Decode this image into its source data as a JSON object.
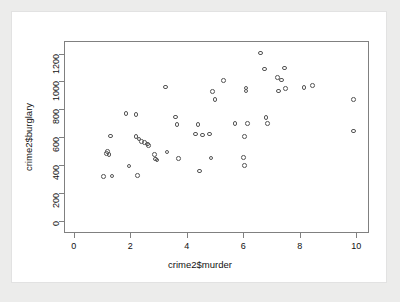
{
  "chart_data": {
    "type": "scatter",
    "title": "",
    "xlabel": "crime2$murder",
    "ylabel": "crime2$burglary",
    "xlim": [
      -0.35,
      10.45
    ],
    "ylim": [
      -85,
      1290
    ],
    "xticks": [
      0,
      2,
      4,
      6,
      8,
      10
    ],
    "yticks": [
      0,
      200,
      400,
      600,
      800,
      1000,
      1200
    ],
    "grid": false,
    "legend": null,
    "point_symbol": "open-circle",
    "point_color": "#555555",
    "points": [
      {
        "x": 1.05,
        "y": 318
      },
      {
        "x": 1.15,
        "y": 485
      },
      {
        "x": 1.2,
        "y": 500
      },
      {
        "x": 1.3,
        "y": 610
      },
      {
        "x": 1.25,
        "y": 478
      },
      {
        "x": 1.35,
        "y": 322
      },
      {
        "x": 1.85,
        "y": 772
      },
      {
        "x": 1.95,
        "y": 395
      },
      {
        "x": 2.2,
        "y": 762
      },
      {
        "x": 2.2,
        "y": 608
      },
      {
        "x": 2.25,
        "y": 328
      },
      {
        "x": 2.3,
        "y": 588
      },
      {
        "x": 2.4,
        "y": 570
      },
      {
        "x": 2.5,
        "y": 562
      },
      {
        "x": 2.6,
        "y": 552
      },
      {
        "x": 2.65,
        "y": 540
      },
      {
        "x": 2.85,
        "y": 478
      },
      {
        "x": 2.9,
        "y": 445
      },
      {
        "x": 2.95,
        "y": 438
      },
      {
        "x": 3.25,
        "y": 962
      },
      {
        "x": 3.3,
        "y": 495
      },
      {
        "x": 3.6,
        "y": 745
      },
      {
        "x": 3.65,
        "y": 690
      },
      {
        "x": 3.7,
        "y": 448
      },
      {
        "x": 4.3,
        "y": 625
      },
      {
        "x": 4.4,
        "y": 692
      },
      {
        "x": 4.45,
        "y": 358
      },
      {
        "x": 4.55,
        "y": 618
      },
      {
        "x": 4.8,
        "y": 625
      },
      {
        "x": 4.85,
        "y": 452
      },
      {
        "x": 4.9,
        "y": 928
      },
      {
        "x": 5.0,
        "y": 872
      },
      {
        "x": 5.3,
        "y": 1008
      },
      {
        "x": 5.7,
        "y": 698
      },
      {
        "x": 6.0,
        "y": 455
      },
      {
        "x": 6.05,
        "y": 398
      },
      {
        "x": 6.05,
        "y": 608
      },
      {
        "x": 6.1,
        "y": 952
      },
      {
        "x": 6.1,
        "y": 932
      },
      {
        "x": 6.15,
        "y": 698
      },
      {
        "x": 6.6,
        "y": 1205
      },
      {
        "x": 6.75,
        "y": 1090
      },
      {
        "x": 6.8,
        "y": 742
      },
      {
        "x": 6.85,
        "y": 698
      },
      {
        "x": 7.2,
        "y": 1030
      },
      {
        "x": 7.25,
        "y": 932
      },
      {
        "x": 7.35,
        "y": 1012
      },
      {
        "x": 7.45,
        "y": 1098
      },
      {
        "x": 7.5,
        "y": 948
      },
      {
        "x": 8.15,
        "y": 955
      },
      {
        "x": 8.45,
        "y": 972
      },
      {
        "x": 9.9,
        "y": 872
      },
      {
        "x": 9.9,
        "y": 645
      }
    ]
  },
  "axes": {
    "x_tick_labels": [
      "0",
      "2",
      "4",
      "6",
      "8",
      "10"
    ],
    "y_tick_labels": [
      "0",
      "200",
      "400",
      "600",
      "800",
      "1000",
      "1200"
    ],
    "x_axis_title": "crime2$murder",
    "y_axis_title": "crime2$burglary"
  },
  "colors": {
    "page_background": "#ececeb",
    "card_background": "#ffffff",
    "frame": "#808080",
    "point": "#555555",
    "text": "#111111"
  },
  "footer": {
    "cut_off_text": ""
  }
}
